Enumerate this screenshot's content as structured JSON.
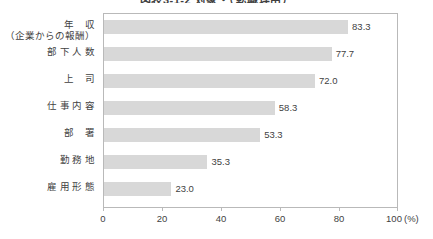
{
  "chart_data": {
    "type": "bar",
    "orientation": "horizontal",
    "title": "図表3-1-2  対象・（転職理由）",
    "xlabel": "(%)",
    "ylabel": "",
    "xlim": [
      0,
      100
    ],
    "xticks": [
      0,
      20,
      40,
      60,
      80,
      100
    ],
    "xtick_labels": [
      "0",
      "20",
      "40",
      "60",
      "80",
      "100"
    ],
    "grid": false,
    "legend": false,
    "categories": [
      "年　　収\n（企業からの報酬）",
      "部 下 人 数",
      "上　　司",
      "仕 事 内 容",
      "部　　署",
      "勤 務 地",
      "雇 用 形 態"
    ],
    "values": [
      83.3,
      77.7,
      72.0,
      58.3,
      53.3,
      35.3,
      23.0
    ],
    "value_labels": [
      "83.3",
      "77.7",
      "72.0",
      "58.3",
      "53.3",
      "35.3",
      "23.0"
    ],
    "bar_color": "#d8d8d8",
    "frame_color": "#b9b9b9",
    "text_color": "#3f3f3f"
  },
  "categories": [
    {
      "line1": "年",
      "line1b": "収",
      "line2": "（企業からの報酬）"
    },
    {
      "line1": "部 下 人 数",
      "line1b": "",
      "line2": ""
    },
    {
      "line1": "上",
      "line1b": "司",
      "line2": ""
    },
    {
      "line1": "仕 事 内 容",
      "line1b": "",
      "line2": ""
    },
    {
      "line1": "部",
      "line1b": "署",
      "line2": ""
    },
    {
      "line1": "勤 務 地",
      "line1b": "",
      "line2": ""
    },
    {
      "line1": "雇 用 形 態",
      "line1b": "",
      "line2": ""
    }
  ],
  "axis": {
    "unit": "(%)",
    "ticks": [
      "0",
      "20",
      "40",
      "60",
      "80",
      "100"
    ]
  },
  "values": {
    "v0": "83.3",
    "v1": "77.7",
    "v2": "72.0",
    "v3": "58.3",
    "v4": "53.3",
    "v5": "35.3",
    "v6": "23.0"
  }
}
